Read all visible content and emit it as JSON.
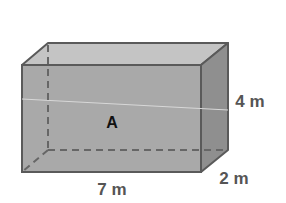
{
  "diagram": {
    "type": "rectangular-prism",
    "face_label": "A",
    "dimensions": {
      "length": "7 m",
      "height": "4 m",
      "depth": "2 m"
    },
    "colors": {
      "front_face": "#a9a9a9",
      "top_face": "#c4c4c4",
      "right_face": "#8f8f8f",
      "edge": "#5a5a5a",
      "label": "#555555"
    }
  }
}
